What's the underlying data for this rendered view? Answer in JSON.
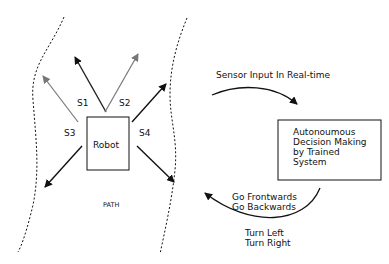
{
  "robot": {
    "label": "Robot"
  },
  "sensors": {
    "s1": "S1",
    "s2": "S2",
    "s3": "S3",
    "s4": "S4"
  },
  "path_label": "PATH",
  "sensor_input_label": "Sensor Input In Real-time",
  "decision_box": {
    "lines": [
      "Autonoumous",
      "Decision Making",
      "by Trained",
      "System"
    ]
  },
  "movement": {
    "line1": "Go Frontwards",
    "line2": "Go Backwards",
    "line3": "Turn Left",
    "line4": "Turn Right"
  }
}
